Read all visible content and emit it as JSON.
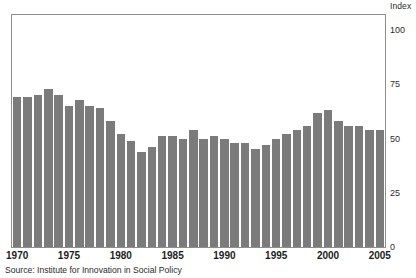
{
  "chart_data": {
    "type": "bar",
    "title": "",
    "subtitle": "",
    "xlabel": "",
    "ylabel": "Index",
    "ylim": [
      0,
      107
    ],
    "yticks": [
      0,
      25,
      50,
      75,
      100
    ],
    "ytick_labels": [
      "0",
      "25",
      "50",
      "75",
      "100"
    ],
    "grid": false,
    "legend": null,
    "bar_color": "#7b7b7b",
    "frame_color": "#8f8f8f",
    "categories": [
      "1970",
      "1971",
      "1972",
      "1973",
      "1974",
      "1975",
      "1976",
      "1977",
      "1978",
      "1979",
      "1980",
      "1981",
      "1982",
      "1983",
      "1984",
      "1985",
      "1986",
      "1987",
      "1988",
      "1989",
      "1990",
      "1991",
      "1992",
      "1993",
      "1994",
      "1995",
      "1996",
      "1997",
      "1998",
      "1999",
      "2000",
      "2001",
      "2002",
      "2003",
      "2004",
      "2005"
    ],
    "values": [
      69,
      69,
      70,
      73,
      70,
      65,
      68,
      65,
      64,
      58,
      52,
      49,
      44,
      46,
      51,
      51,
      50,
      54,
      50,
      51,
      50,
      48,
      48,
      45,
      47,
      50,
      52,
      54,
      56,
      62,
      63,
      58,
      56,
      56,
      54,
      54
    ],
    "xtick_labels": [
      "1970",
      "1975",
      "1980",
      "1985",
      "1990",
      "1995",
      "2000",
      "2005"
    ],
    "xtick_categories": [
      "1970",
      "1975",
      "1980",
      "1985",
      "1990",
      "1995",
      "2000",
      "2005"
    ],
    "source": "Source: Institute for Innovation in Social Policy"
  }
}
